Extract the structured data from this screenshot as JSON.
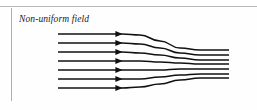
{
  "figure": {
    "caption": "Non-uniform field",
    "background_color": "#fefefe",
    "rule_color": "#b9b9b9",
    "line_color": "#111111"
  },
  "chart_data": {
    "type": "line",
    "title": "Non-uniform field",
    "subtitle": "",
    "xlabel": "",
    "ylabel": "",
    "xlim": [
      0,
      257
    ],
    "ylim": [
      0,
      110
    ],
    "grid": false,
    "legend": null,
    "annotations": [
      "Non-uniform field"
    ],
    "line_count": 7,
    "arrow_x": 122,
    "x_start": 58,
    "x_end": 229,
    "series": [
      {
        "name": "field-line-1",
        "x": [
          58,
          122,
          140,
          160,
          180,
          200,
          229
        ],
        "y": [
          34,
          34,
          35,
          41,
          48,
          50,
          50
        ]
      },
      {
        "name": "field-line-2",
        "x": [
          58,
          122,
          140,
          160,
          180,
          200,
          229
        ],
        "y": [
          43,
          43,
          44,
          48,
          53,
          55,
          55
        ]
      },
      {
        "name": "field-line-3",
        "x": [
          58,
          122,
          140,
          160,
          180,
          200,
          229
        ],
        "y": [
          52,
          52,
          53,
          55,
          58,
          60,
          60
        ]
      },
      {
        "name": "field-line-4",
        "x": [
          58,
          122,
          140,
          160,
          180,
          200,
          229
        ],
        "y": [
          61,
          61,
          61,
          62,
          63,
          64,
          64
        ]
      },
      {
        "name": "field-line-5",
        "x": [
          58,
          122,
          140,
          160,
          180,
          200,
          229
        ],
        "y": [
          70,
          70,
          70,
          70,
          69,
          69,
          69
        ]
      },
      {
        "name": "field-line-6",
        "x": [
          58,
          122,
          140,
          160,
          180,
          200,
          229
        ],
        "y": [
          79,
          79,
          79,
          77,
          75,
          74,
          74
        ]
      },
      {
        "name": "field-line-7",
        "x": [
          58,
          122,
          140,
          160,
          180,
          200,
          229
        ],
        "y": [
          88,
          88,
          87,
          84,
          80,
          78,
          78
        ]
      }
    ]
  }
}
